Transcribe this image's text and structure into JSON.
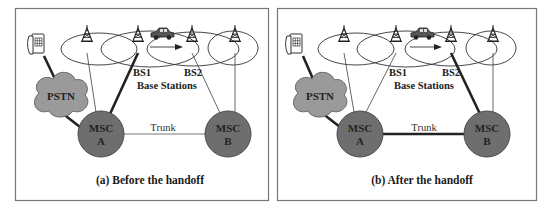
{
  "figure": {
    "colors": {
      "border": "#777777",
      "msc_fill": "#6e6e6e",
      "pstn_fill": "#9a9a9a",
      "line": "#222222",
      "thin_line": "#555555"
    },
    "panels": [
      {
        "id": "a",
        "caption": "(a) Before the handoff",
        "pstn_label": "PSTN",
        "msc_a": {
          "line1": "MSC",
          "line2": "A"
        },
        "msc_b": {
          "line1": "MSC",
          "line2": "B"
        },
        "trunk_label": "Trunk",
        "bs1_label": "BS1",
        "bs2_label": "BS2",
        "base_stations_label": "Base Stations",
        "active_link": "MSC A - BS1",
        "trunk_active": false
      },
      {
        "id": "b",
        "caption": "(b) After the handoff",
        "pstn_label": "PSTN",
        "msc_a": {
          "line1": "MSC",
          "line2": "A"
        },
        "msc_b": {
          "line1": "MSC",
          "line2": "B"
        },
        "trunk_label": "Trunk",
        "bs1_label": "BS1",
        "bs2_label": "BS2",
        "base_stations_label": "Base Stations",
        "active_link": "MSC B - BS2",
        "trunk_active": true
      }
    ],
    "icons": [
      "telephone-icon",
      "cell-tower-icon",
      "car-icon",
      "cloud-icon"
    ]
  }
}
